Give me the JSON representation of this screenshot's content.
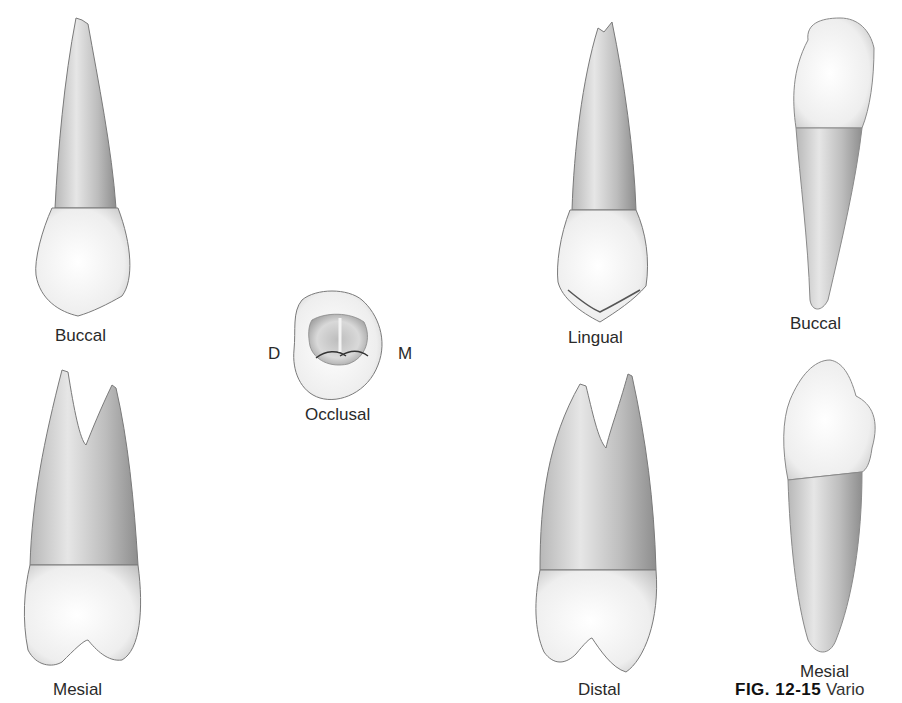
{
  "figure": {
    "number_label": "FIG. 12-15",
    "caption_visible_text": "Vario",
    "views": [
      {
        "id": "maxillary-buccal",
        "label": "Buccal"
      },
      {
        "id": "occlusal",
        "label": "Occlusal",
        "orientation": {
          "left": "D",
          "right": "M"
        }
      },
      {
        "id": "maxillary-lingual",
        "label": "Lingual"
      },
      {
        "id": "mandibular-buccal",
        "label": "Buccal"
      },
      {
        "id": "maxillary-mesial",
        "label": "Mesial"
      },
      {
        "id": "maxillary-distal",
        "label": "Distal"
      },
      {
        "id": "mandibular-mesial",
        "label": "Mesial"
      }
    ]
  },
  "colors": {
    "background": "#ffffff",
    "crown": "#f2f2f2",
    "root_light": "#d8d8d8",
    "root_dark": "#9a9a9a",
    "outline": "#6a6a6a",
    "label": "#2a2a2a"
  }
}
